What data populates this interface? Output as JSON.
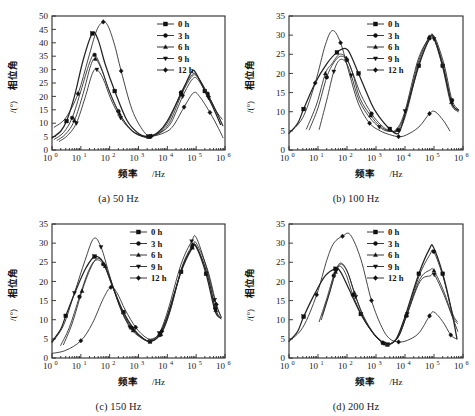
{
  "figure": {
    "width": 475,
    "height": 416,
    "background": "#ffffff",
    "line_color": "#232323",
    "text_color": "#1a1a1a"
  },
  "common": {
    "xlabel_main": "频率",
    "xlabel_unit": "/Hz",
    "ylabel_main": "相位角",
    "ylabel_unit": "/(°)",
    "x_tick_base": "10",
    "x_tick_exponents": [
      "0",
      "1",
      "2",
      "3",
      "4",
      "5",
      "6"
    ],
    "legend_entries": [
      {
        "label": "0 h",
        "marker": "square"
      },
      {
        "label": "3 h",
        "marker": "circle"
      },
      {
        "label": "6 h",
        "marker": "triangle"
      },
      {
        "label": "9 h",
        "marker": "triangle-down"
      },
      {
        "label": "12 h",
        "marker": "diamond"
      }
    ]
  },
  "chart_data": [
    {
      "id": "panel-a",
      "type": "line",
      "title": "(a) 50 Hz",
      "caption": "(a) 50 Hz",
      "xlabel": "频率 /Hz",
      "ylabel": "相位角 /(°)",
      "xscale": "log",
      "xlim": [
        1,
        1000000
      ],
      "ylim": [
        0,
        50
      ],
      "yticks": [
        0,
        5,
        10,
        15,
        20,
        25,
        30,
        35,
        40,
        45,
        50
      ],
      "xticks": [
        1,
        10,
        100,
        1000,
        10000,
        100000,
        1000000
      ],
      "grid": false,
      "legend_position": "top-right",
      "series": [
        {
          "name": "0 h",
          "marker": "square",
          "x": [
            1.0,
            2.0,
            3.2,
            6.0,
            12,
            25,
            40,
            70,
            150,
            400,
            1000,
            2200,
            5000,
            10000,
            30000,
            70000,
            100000,
            200000,
            400000,
            700000
          ],
          "values": [
            4.5,
            7.0,
            10.8,
            20.0,
            33.5,
            43.5,
            41.0,
            32.0,
            22.0,
            11.0,
            6.2,
            5.0,
            6.8,
            10.8,
            21.0,
            29.2,
            28.5,
            22.0,
            15.5,
            9.5
          ]
        },
        {
          "name": "3 h",
          "marker": "circle",
          "x": [
            1.2,
            2.5,
            5.0,
            10,
            20,
            30,
            50,
            90,
            200,
            500,
            1200,
            2400,
            6000,
            12000,
            30000,
            70000,
            110000,
            250000,
            500000,
            800000
          ],
          "values": [
            4.0,
            6.5,
            12.0,
            22.0,
            32.5,
            35.5,
            31.0,
            23.0,
            14.5,
            8.0,
            5.4,
            5.0,
            7.2,
            11.5,
            21.5,
            28.0,
            27.5,
            21.0,
            14.5,
            11.5
          ]
        },
        {
          "name": "6 h",
          "marker": "triangle",
          "x": [
            1.5,
            3.0,
            6.0,
            12,
            22,
            32,
            55,
            100,
            220,
            550,
            1300,
            2500,
            6500,
            13000,
            32000,
            72000,
            115000,
            260000,
            520000,
            820000
          ],
          "values": [
            3.6,
            6.0,
            11.0,
            21.0,
            31.5,
            34.0,
            29.5,
            21.5,
            13.5,
            7.6,
            5.2,
            5.0,
            7.0,
            11.0,
            21.0,
            27.5,
            27.0,
            20.5,
            14.0,
            9.2
          ]
        },
        {
          "name": "9 h",
          "marker": "triangle-down",
          "x": [
            1.8,
            3.5,
            7.0,
            14,
            25,
            36,
            60,
            110,
            240,
            600,
            1400,
            2600,
            7000,
            14000,
            34000,
            75000,
            120000,
            270000,
            540000,
            850000
          ],
          "values": [
            3.2,
            5.5,
            10.0,
            19.5,
            28.5,
            30.0,
            26.5,
            19.0,
            12.0,
            7.0,
            5.0,
            5.0,
            7.0,
            10.5,
            20.0,
            26.5,
            26.0,
            19.5,
            13.5,
            9.0
          ]
        },
        {
          "name": "12 h",
          "marker": "diamond",
          "x": [
            1.2,
            3.0,
            8.0,
            18,
            35,
            60,
            90,
            150,
            250,
            600,
            1500,
            2800,
            8000,
            16000,
            38000,
            80000,
            130000,
            300000,
            600000,
            850000
          ],
          "values": [
            8.5,
            12.0,
            21.0,
            34.0,
            44.5,
            47.8,
            46.0,
            39.0,
            29.5,
            15.0,
            7.0,
            5.2,
            6.5,
            9.0,
            16.0,
            21.3,
            20.0,
            14.0,
            8.0,
            4.6
          ]
        }
      ]
    },
    {
      "id": "panel-b",
      "type": "line",
      "title": "(b) 100 Hz",
      "caption": "(b) 100 Hz",
      "xlabel": "频率 /Hz",
      "ylabel": "相位角 /(°)",
      "xscale": "log",
      "xlim": [
        1,
        1000000
      ],
      "ylim": [
        0,
        35
      ],
      "yticks": [
        0,
        5,
        10,
        15,
        20,
        25,
        30,
        35
      ],
      "xticks": [
        1,
        10,
        100,
        1000,
        10000,
        100000,
        1000000
      ],
      "grid": false,
      "legend_position": "top-center",
      "series": [
        {
          "name": "0 h",
          "marker": "square",
          "x": [
            1.0,
            2.0,
            3.2,
            8.0,
            20,
            45,
            90,
            130,
            250,
            700,
            1200,
            3000,
            6000,
            10000,
            30000,
            70000,
            100000,
            200000,
            400000,
            700000
          ],
          "values": [
            4.4,
            7.0,
            10.7,
            17.5,
            22.5,
            25.5,
            26.5,
            25.0,
            20.0,
            12.0,
            9.0,
            5.5,
            4.4,
            9.3,
            22.0,
            29.0,
            29.2,
            22.0,
            12.4,
            10.4
          ]
        },
        {
          "name": "3 h",
          "marker": "circle",
          "x": [
            5.0,
            10,
            20,
            35,
            60,
            100,
            160,
            300,
            700,
            1500,
            3000,
            6000,
            11000,
            30000,
            70000,
            105000,
            220000,
            420000,
            720000
          ],
          "values": [
            5.3,
            11.0,
            19.0,
            22.8,
            24.5,
            23.5,
            20.0,
            14.5,
            9.5,
            6.5,
            5.0,
            5.2,
            9.5,
            22.5,
            29.2,
            29.5,
            22.5,
            13.0,
            10.5
          ]
        },
        {
          "name": "6 h",
          "marker": "triangle",
          "x": [
            4.0,
            9.0,
            18,
            30,
            55,
            95,
            150,
            280,
            650,
            1400,
            2800,
            5500,
            10500,
            29000,
            68000,
            102000,
            210000,
            400000,
            700000
          ],
          "values": [
            5.5,
            12.0,
            20.0,
            22.5,
            25.0,
            24.0,
            20.5,
            13.5,
            9.0,
            6.2,
            5.0,
            5.3,
            10.0,
            23.0,
            29.5,
            29.3,
            22.0,
            12.5,
            10.2
          ]
        },
        {
          "name": "9 h",
          "marker": "triangle-down",
          "x": [
            11,
            20,
            35,
            55,
            90,
            140,
            260,
            600,
            1300,
            2600,
            5200,
            10000,
            28000,
            66000,
            100000,
            200000,
            380000,
            680000
          ],
          "values": [
            5.4,
            13.0,
            20.5,
            23.5,
            23.0,
            19.5,
            13.0,
            8.5,
            6.0,
            4.9,
            5.5,
            10.2,
            23.5,
            29.0,
            29.0,
            21.5,
            12.2,
            10.0
          ]
        },
        {
          "name": "12 h",
          "marker": "diamond",
          "x": [
            1.0,
            3.0,
            8.0,
            18,
            32,
            60,
            120,
            250,
            600,
            1400,
            3000,
            6000,
            11000,
            30000,
            70000,
            110000,
            220000,
            350000
          ],
          "values": [
            4.4,
            8.5,
            17.5,
            27.5,
            31.2,
            28.0,
            20.0,
            12.0,
            7.0,
            5.0,
            4.0,
            3.5,
            3.9,
            6.0,
            9.5,
            10.0,
            7.5,
            5.0
          ]
        }
      ]
    },
    {
      "id": "panel-c",
      "type": "line",
      "title": "(c) 150 Hz",
      "caption": "(c) 150 Hz",
      "xlabel": "频率 /Hz",
      "ylabel": "相位角 /(°)",
      "xscale": "log",
      "xlim": [
        1,
        1000000
      ],
      "ylim": [
        0,
        35
      ],
      "yticks": [
        0,
        5,
        10,
        15,
        20,
        25,
        30,
        35
      ],
      "xticks": [
        1,
        10,
        100,
        1000,
        10000,
        100000,
        1000000
      ],
      "grid": false,
      "legend_position": "top-center",
      "series": [
        {
          "name": "0 h",
          "marker": "square",
          "x": [
            1.0,
            2.0,
            3.0,
            7.0,
            15,
            30,
            60,
            130,
            300,
            700,
            1500,
            2500,
            5000,
            10000,
            30000,
            70000,
            100000,
            220000,
            450000,
            700000
          ],
          "values": [
            4.3,
            7.5,
            11.0,
            18.0,
            23.5,
            26.5,
            25.0,
            18.5,
            12.0,
            7.5,
            5.0,
            4.3,
            5.8,
            11.0,
            22.5,
            28.5,
            29.0,
            22.0,
            12.3,
            10.4
          ]
        },
        {
          "name": "3 h",
          "marker": "circle",
          "x": [
            2.0,
            4.0,
            9.0,
            18,
            32,
            60,
            120,
            260,
            600,
            1400,
            2600,
            5500,
            11000,
            31000,
            72000,
            102000,
            230000,
            460000,
            720000
          ],
          "values": [
            3.3,
            8.0,
            16.0,
            22.5,
            25.5,
            24.5,
            19.0,
            12.5,
            7.8,
            5.2,
            4.4,
            6.0,
            11.5,
            23.0,
            29.0,
            29.2,
            22.5,
            13.0,
            10.5
          ]
        },
        {
          "name": "6 h",
          "marker": "triangle",
          "x": [
            2.5,
            5.0,
            11,
            22,
            38,
            70,
            140,
            290,
            650,
            1500,
            2700,
            6000,
            12000,
            32000,
            74000,
            104000,
            240000,
            480000,
            740000
          ],
          "values": [
            3.5,
            9.0,
            17.5,
            23.5,
            26.0,
            24.0,
            18.0,
            11.5,
            7.2,
            5.0,
            4.5,
            6.2,
            11.8,
            23.5,
            28.8,
            29.0,
            22.0,
            12.5,
            10.2
          ]
        },
        {
          "name": "9 h",
          "marker": "triangle-down",
          "x": [
            1.0,
            2.5,
            6.0,
            14,
            28,
            50,
            100,
            220,
            500,
            1200,
            2400,
            5200,
            10500,
            30000,
            70000,
            100000,
            220000,
            440000,
            700000
          ],
          "values": [
            4.0,
            8.5,
            17.0,
            25.5,
            31.2,
            29.0,
            21.5,
            13.5,
            8.0,
            5.3,
            4.5,
            6.5,
            12.5,
            24.5,
            30.5,
            31.5,
            24.0,
            15.2,
            11.0
          ]
        },
        {
          "name": "12 h",
          "marker": "diamond",
          "x": [
            1.0,
            3.0,
            10,
            25,
            60,
            110,
            180,
            350,
            800,
            1700,
            3000,
            6500,
            13000,
            33000,
            75000,
            105000,
            250000,
            500000,
            760000
          ],
          "values": [
            1.2,
            2.0,
            4.5,
            9.0,
            15.5,
            18.5,
            17.0,
            12.5,
            8.0,
            5.5,
            5.0,
            7.0,
            12.8,
            24.0,
            29.5,
            29.8,
            23.0,
            14.0,
            10.6
          ]
        }
      ]
    },
    {
      "id": "panel-d",
      "type": "line",
      "title": "(d) 200 Hz",
      "caption": "(d) 200 Hz",
      "xlabel": "频率 /Hz",
      "ylabel": "相位角 /(°)",
      "xscale": "log",
      "xlim": [
        1,
        1000000
      ],
      "ylim": [
        0,
        35
      ],
      "yticks": [
        0,
        5,
        10,
        15,
        20,
        25,
        30,
        35
      ],
      "xticks": [
        1,
        10,
        100,
        1000,
        10000,
        100000,
        1000000
      ],
      "grid": false,
      "legend_position": "top-center",
      "series": [
        {
          "name": "0 h",
          "marker": "square",
          "x": [
            1.0,
            2.0,
            3.2,
            8.0,
            18,
            40,
            60,
            120,
            300,
            800,
            1600,
            2500,
            5000,
            10000,
            30000,
            70000,
            95000,
            200000,
            400000,
            620000
          ],
          "values": [
            4.4,
            7.0,
            10.8,
            17.0,
            21.5,
            23.3,
            22.5,
            17.8,
            11.5,
            6.5,
            4.2,
            3.5,
            5.0,
            10.8,
            22.0,
            28.5,
            29.0,
            22.0,
            12.5,
            5.0
          ]
        },
        {
          "name": "3 h",
          "marker": "circle",
          "x": [
            11,
            20,
            35,
            55,
            90,
            160,
            350,
            850,
            1700,
            2700,
            5500,
            11000,
            31000,
            72000,
            98000,
            210000,
            420000,
            640000
          ],
          "values": [
            9.5,
            15.5,
            21.5,
            24.0,
            22.0,
            16.5,
            10.5,
            6.2,
            4.0,
            3.4,
            5.2,
            11.0,
            21.5,
            27.0,
            27.8,
            21.0,
            12.0,
            9.5
          ]
        },
        {
          "name": "6 h",
          "marker": "triangle",
          "x": [
            13,
            24,
            40,
            60,
            100,
            180,
            380,
            900,
            1800,
            2800,
            5800,
            11500,
            32000,
            74000,
            100000,
            215000,
            430000,
            650000
          ],
          "values": [
            10.0,
            16.5,
            22.5,
            24.8,
            22.8,
            17.0,
            10.8,
            6.0,
            3.9,
            3.5,
            5.5,
            11.2,
            20.5,
            23.0,
            22.8,
            17.5,
            11.0,
            9.0
          ]
        },
        {
          "name": "9 h",
          "marker": "triangle-down",
          "x": [
            14,
            26,
            44,
            65,
            110,
            200,
            400,
            950,
            1900,
            2900,
            6000,
            12000,
            33000,
            76000,
            102000,
            220000,
            440000,
            660000
          ],
          "values": [
            11.0,
            17.5,
            23.0,
            24.5,
            22.0,
            16.0,
            10.0,
            5.8,
            3.8,
            3.6,
            5.6,
            11.5,
            20.0,
            21.5,
            21.8,
            16.5,
            10.5,
            7.0
          ]
        },
        {
          "name": "12 h",
          "marker": "diamond",
          "x": [
            1.0,
            3.0,
            9.0,
            20,
            35,
            70,
            130,
            300,
            700,
            1600,
            3000,
            6000,
            12000,
            30000,
            70000,
            100000,
            200000,
            380000,
            600000
          ],
          "values": [
            4.4,
            8.0,
            16.5,
            25.5,
            30.0,
            31.8,
            32.2,
            25.8,
            15.0,
            8.0,
            5.0,
            4.2,
            4.6,
            6.5,
            11.0,
            12.0,
            9.5,
            6.0,
            5.0
          ]
        }
      ]
    }
  ]
}
